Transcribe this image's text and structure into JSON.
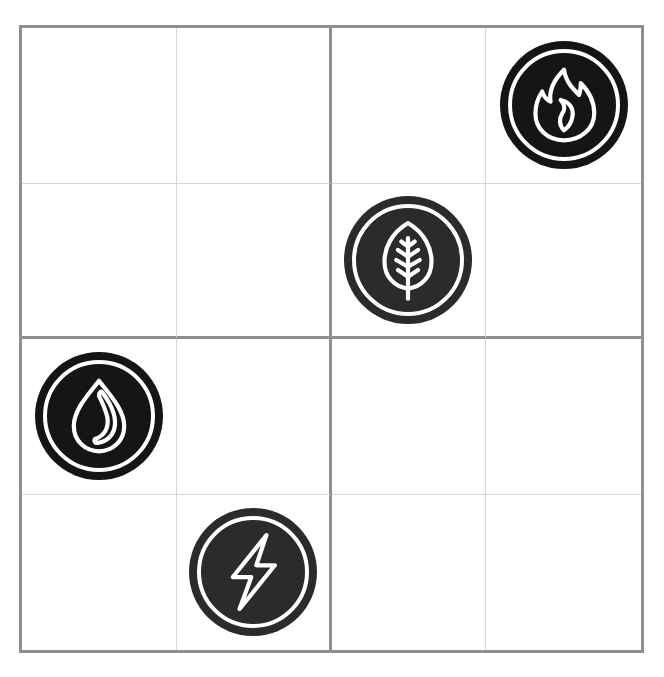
{
  "puzzle": {
    "rows": 4,
    "cols": 4,
    "box_size": 2,
    "colors": {
      "thick_line": "#8f8f8f",
      "thin_line": "#d6d6d6",
      "token_fill": "#2b2b2b",
      "token_fill_dark": "#151515",
      "icon_stroke": "#ffffff"
    },
    "pieces": [
      {
        "row": 0,
        "col": 3,
        "symbol": "fire-icon",
        "label": "fire"
      },
      {
        "row": 1,
        "col": 2,
        "symbol": "leaf-icon",
        "label": "leaf"
      },
      {
        "row": 2,
        "col": 0,
        "symbol": "water-drop-icon",
        "label": "water"
      },
      {
        "row": 3,
        "col": 1,
        "symbol": "lightning-icon",
        "label": "lightning"
      }
    ]
  }
}
